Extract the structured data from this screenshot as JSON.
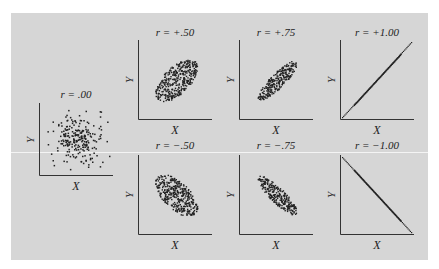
{
  "chart_data": {
    "type": "scatter",
    "title": "",
    "grid": false,
    "panels": [
      {
        "id": "r000",
        "title": "r = .00",
        "r": 0.0,
        "xlabel": "X",
        "ylabel": "Y",
        "shape": "circular cloud"
      },
      {
        "id": "rp050",
        "title": "r = +.50",
        "r": 0.5,
        "xlabel": "X",
        "ylabel": "Y",
        "shape": "wide ellipse, positive slope"
      },
      {
        "id": "rp075",
        "title": "r = +.75",
        "r": 0.75,
        "xlabel": "X",
        "ylabel": "Y",
        "shape": "narrow ellipse, positive slope"
      },
      {
        "id": "rp100",
        "title": "r = +1.00",
        "r": 1.0,
        "xlabel": "X",
        "ylabel": "Y",
        "shape": "straight line, positive slope"
      },
      {
        "id": "rm050",
        "title": "r = −.50",
        "r": -0.5,
        "xlabel": "X",
        "ylabel": "Y",
        "shape": "wide ellipse, negative slope"
      },
      {
        "id": "rm075",
        "title": "r = −.75",
        "r": -0.75,
        "xlabel": "X",
        "ylabel": "Y",
        "shape": "narrow ellipse, negative slope"
      },
      {
        "id": "rm100",
        "title": "r = −1.00",
        "r": -1.0,
        "xlabel": "X",
        "ylabel": "Y",
        "shape": "straight line, negative slope"
      }
    ]
  },
  "colors": {
    "panel": "#d6d6d6",
    "ink": "#222222",
    "divider": "#f4f4f4"
  }
}
